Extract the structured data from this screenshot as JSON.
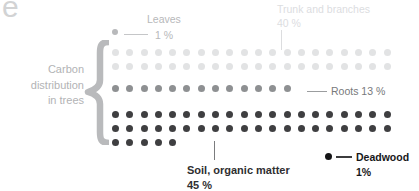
{
  "corner": {
    "letter": "e"
  },
  "left_label": {
    "lines": [
      "Carbon",
      "distribution",
      "in trees"
    ]
  },
  "colors": {
    "leaves": "#b8b9bb",
    "trunk": "#e2e3e4",
    "roots": "#8e9092",
    "soil": "#3f3f41",
    "deadwood": "#141416",
    "brace": "#b9babc",
    "corner_letter": "#d2d3d4"
  },
  "callouts": {
    "leaves": {
      "label": "Leaves",
      "value": "1 %"
    },
    "trunk": {
      "label": "Trunk and branches",
      "value": "40 %"
    },
    "roots": {
      "label": "Roots 13 %"
    },
    "soil": {
      "label": "Soil, organic matter",
      "value": "45 %"
    },
    "deadwood": {
      "label": "Deadwood",
      "value": "1%"
    }
  },
  "chart_data": {
    "type": "pictogram",
    "title": "Carbon distribution in trees",
    "unit": "1 dot = 1 %",
    "total": 100,
    "categories": [
      "Leaves",
      "Trunk and branches",
      "Roots",
      "Soil, organic matter",
      "Deadwood"
    ],
    "values": [
      1,
      40,
      13,
      45,
      1
    ],
    "labels": [
      "1 %",
      "40 %",
      "13 %",
      "45 %",
      "1%"
    ],
    "series": [
      {
        "name": "Leaves",
        "value": 1,
        "color": "#b8b9bb",
        "dots": 1,
        "rows": [
          1
        ]
      },
      {
        "name": "Trunk and branches",
        "value": 40,
        "color": "#e2e3e4",
        "dots": 40,
        "rows": [
          20,
          20
        ]
      },
      {
        "name": "Roots",
        "value": 13,
        "color": "#8e9092",
        "dots": 13,
        "rows": [
          13
        ]
      },
      {
        "name": "Soil, organic matter",
        "value": 45,
        "color": "#3f3f41",
        "dots": 45,
        "rows": [
          20,
          20,
          5
        ]
      },
      {
        "name": "Deadwood",
        "value": 1,
        "color": "#141416",
        "dots": 1,
        "rows": [
          1
        ]
      }
    ],
    "legend_position": "inline-callouts",
    "grid": false
  }
}
